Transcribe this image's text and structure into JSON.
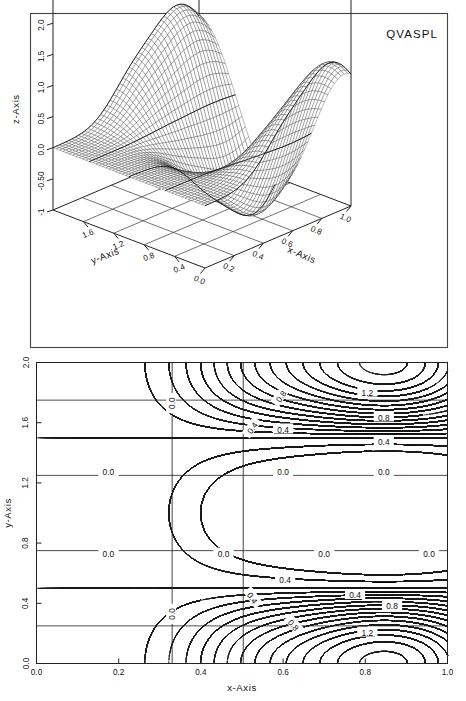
{
  "figure": {
    "title": "QVASPL",
    "panels": [
      "surface-3d",
      "contour-2d"
    ]
  },
  "surface_panel": {
    "title": "QVASPL",
    "x_axis_label": "x-Axis",
    "y_axis_label": "y-Axis",
    "z_axis_label": "z-Axis",
    "x_ticks": [
      "0.0",
      "0.2",
      "0.4",
      "0.6",
      "0.8",
      "1.0"
    ],
    "y_ticks": [
      "0.4",
      "0.8",
      "1.2",
      "1.6"
    ],
    "z_ticks": [
      "-1",
      "-0.50",
      "0.0",
      "0.5",
      "1.0",
      "1.5",
      "2.0",
      "2.5"
    ]
  },
  "contour_panel": {
    "x_axis_label": "x-Axis",
    "y_axis_label": "y-Axis",
    "x_ticks": [
      "0.0",
      "0.2",
      "0.4",
      "0.6",
      "0.8",
      "1.0"
    ],
    "y_ticks": [
      "0.0",
      "0.4",
      "0.8",
      "1.2",
      "1.6",
      "2.0"
    ],
    "contour_labels": [
      "0.0",
      "0.4",
      "0.8",
      "1.2"
    ]
  },
  "chart_data": {
    "type": "line",
    "title": "QVASPL",
    "subtitle": "",
    "xlabel": "x-Axis",
    "ylabel": "y-Axis",
    "zlabel": "z-Axis",
    "grid": true,
    "legend": "none",
    "panels": [
      {
        "id": "surface-3d",
        "kind": "surface",
        "xlim": [
          0.0,
          1.0
        ],
        "ylim": [
          0.0,
          2.0
        ],
        "zlim": [
          -1.0,
          2.5
        ],
        "xticks": [
          0.0,
          0.2,
          0.4,
          0.6,
          0.8,
          1.0
        ],
        "yticks": [
          0.4,
          0.8,
          1.2,
          1.6
        ],
        "zticks": [
          -1.0,
          -0.5,
          0.0,
          0.5,
          1.0,
          1.5,
          2.0,
          2.5
        ],
        "xtick_labels": [
          "0.0",
          "0.2",
          "0.4",
          "0.6",
          "0.8",
          "1.0"
        ],
        "ytick_labels": [
          "0.4",
          "0.8",
          "1.2",
          "1.6"
        ],
        "ztick_labels": [
          "-1",
          "-0.50",
          "0.0",
          "0.5",
          "1.0",
          "1.5",
          "2.0",
          "2.5"
        ],
        "mesh_nx": 46,
        "mesh_ny": 46,
        "peaks": [
          {
            "x": 0.85,
            "y": 0.25,
            "z": 1.45
          },
          {
            "x": 0.85,
            "y": 1.75,
            "z": 1.45
          }
        ],
        "description": "Two ridge-like maxima of height about 1.4 rising from a flat zero plane; surface falls to ~0 along x<0.4 and at y near 1.0."
      },
      {
        "id": "contour-2d",
        "kind": "contour",
        "xlim": [
          0.0,
          1.0
        ],
        "ylim": [
          0.0,
          2.0
        ],
        "xticks": [
          0.0,
          0.2,
          0.4,
          0.6,
          0.8,
          1.0
        ],
        "yticks": [
          0.0,
          0.4,
          0.8,
          1.2,
          1.6,
          2.0
        ],
        "xtick_labels": [
          "0.0",
          "0.2",
          "0.4",
          "0.6",
          "0.8",
          "1.0"
        ],
        "ytick_labels": [
          "0.0",
          "0.4",
          "0.8",
          "1.2",
          "1.6",
          "2.0"
        ],
        "levels": [
          -0.4,
          -0.2,
          0.0,
          0.1,
          0.2,
          0.3,
          0.4,
          0.5,
          0.6,
          0.7,
          0.8,
          0.9,
          1.0,
          1.1,
          1.2,
          1.3,
          1.4
        ],
        "labeled_levels": [
          0.0,
          0.4,
          0.8,
          1.2
        ],
        "label_positions": [
          {
            "text": "0.0",
            "x": 0.175,
            "y": 1.27,
            "rotate": 0
          },
          {
            "text": "0.0",
            "x": 0.175,
            "y": 0.73,
            "rotate": 0
          },
          {
            "text": "0.0",
            "x": 0.455,
            "y": 0.73,
            "rotate": 0
          },
          {
            "text": "0.0",
            "x": 0.33,
            "y": 1.73,
            "rotate": -90
          },
          {
            "text": "0.0",
            "x": 0.33,
            "y": 0.33,
            "rotate": -90
          },
          {
            "text": "0.0",
            "x": 0.6,
            "y": 1.27,
            "rotate": 0
          },
          {
            "text": "0.0",
            "x": 0.845,
            "y": 1.27,
            "rotate": 0
          },
          {
            "text": "0.0",
            "x": 0.7,
            "y": 0.73,
            "rotate": 0
          },
          {
            "text": "0.0",
            "x": 0.955,
            "y": 0.73,
            "rotate": 0
          },
          {
            "text": "0.4",
            "x": 0.6,
            "y": 1.555,
            "rotate": 0
          },
          {
            "text": "0.4",
            "x": 0.845,
            "y": 1.47,
            "rotate": 0
          },
          {
            "text": "0.4",
            "x": 0.605,
            "y": 0.555,
            "rotate": 0
          },
          {
            "text": "0.4",
            "x": 0.775,
            "y": 0.455,
            "rotate": 0
          },
          {
            "text": "0.4",
            "x": 0.525,
            "y": 1.565,
            "rotate": -55
          },
          {
            "text": "0.4",
            "x": 0.525,
            "y": 0.435,
            "rotate": 55
          },
          {
            "text": "0.8",
            "x": 0.595,
            "y": 1.775,
            "rotate": -55
          },
          {
            "text": "0.8",
            "x": 0.845,
            "y": 1.635,
            "rotate": 0
          },
          {
            "text": "0.8",
            "x": 0.625,
            "y": 0.255,
            "rotate": 50
          },
          {
            "text": "0.8",
            "x": 0.865,
            "y": 0.38,
            "rotate": 0
          },
          {
            "text": "1.2",
            "x": 0.805,
            "y": 1.8,
            "rotate": 0
          },
          {
            "text": "1.2",
            "x": 0.805,
            "y": 0.205,
            "rotate": 0
          }
        ],
        "description": "Contours of a surface with two elliptical maxima near (0.85, 0.25) and (0.85, 1.75) exceeding 1.2, zero-level lines at y=0.75 and y=1.25 and a vertical zero line near x=0.33, plus closed dashed low-level loops in the lower-left and upper-left corners."
      }
    ]
  }
}
